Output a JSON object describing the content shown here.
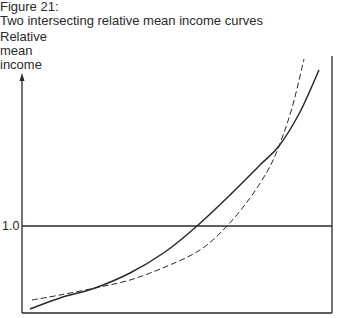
{
  "figure": {
    "label": "Figure 21:",
    "caption": "Two intersecting relative mean income curves"
  },
  "chart_data": {
    "type": "line",
    "title": "Two intersecting relative mean income curves",
    "xlabel": "",
    "ylabel": "Relative mean income",
    "ylabel_lines": [
      "Relative",
      "mean",
      "income"
    ],
    "yticks": [
      {
        "value": 1.0,
        "label": "1.0"
      }
    ],
    "reference_line": {
      "y": 1.0,
      "style": "solid"
    },
    "grid": false,
    "legend": null,
    "series": [
      {
        "name": "Curve A (solid)",
        "style": "solid",
        "points_px": [
          [
            30,
            309
          ],
          [
            60,
            298
          ],
          [
            95,
            288
          ],
          [
            130,
            273
          ],
          [
            165,
            252
          ],
          [
            197,
            226
          ],
          [
            230,
            195
          ],
          [
            260,
            165
          ],
          [
            279,
            146
          ],
          [
            300,
            112
          ],
          [
            319,
            70
          ]
        ]
      },
      {
        "name": "Curve B (dashed)",
        "style": "dashed",
        "points_px": [
          [
            32,
            300
          ],
          [
            60,
            295
          ],
          [
            95,
            288
          ],
          [
            130,
            280
          ],
          [
            165,
            267
          ],
          [
            200,
            250
          ],
          [
            227,
            226
          ],
          [
            250,
            198
          ],
          [
            268,
            170
          ],
          [
            279,
            146
          ],
          [
            292,
            108
          ],
          [
            304,
            59
          ]
        ]
      }
    ],
    "annotations": [
      {
        "type": "intersection",
        "at_px": [
          95,
          288
        ]
      },
      {
        "type": "intersection",
        "at_px": [
          279,
          146
        ]
      }
    ]
  },
  "colors": {
    "ink": "#2a2a2a",
    "background": "#ffffff"
  }
}
